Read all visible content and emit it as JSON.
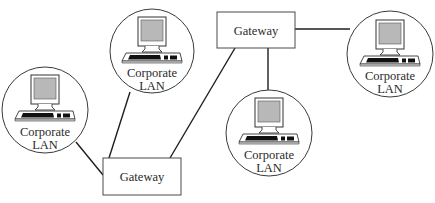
{
  "diagram": {
    "type": "network-topology",
    "colors": {
      "background": "#ffffff",
      "line": "#1e1e1e",
      "outline": "#3a3a3a",
      "screen": "#b8b8b8",
      "keys": "#111111",
      "text": "#2a2a2a"
    },
    "gateways": [
      {
        "id": "gw-bottom",
        "label": "Gateway",
        "x": 103,
        "y": 158,
        "w": 78,
        "h": 37
      },
      {
        "id": "gw-top",
        "label": "Gateway",
        "x": 217,
        "y": 12,
        "w": 78,
        "h": 36
      }
    ],
    "lans": [
      {
        "id": "lan-left",
        "label_line1": "Corporate",
        "label_line2": "LAN",
        "cx": 45,
        "cy": 110,
        "r": 43
      },
      {
        "id": "lan-top-middle",
        "label_line1": "Corporate",
        "label_line2": "LAN",
        "cx": 152,
        "cy": 51,
        "r": 42
      },
      {
        "id": "lan-bottom-middle",
        "label_line1": "Corporate",
        "label_line2": "LAN",
        "cx": 269,
        "cy": 133,
        "r": 43
      },
      {
        "id": "lan-right",
        "label_line1": "Corporate",
        "label_line2": "LAN",
        "cx": 390,
        "cy": 54,
        "r": 43
      }
    ],
    "connections": [
      {
        "from": "lan-left",
        "to": "gw-bottom"
      },
      {
        "from": "lan-top-middle",
        "to": "gw-bottom"
      },
      {
        "from": "gw-bottom",
        "to": "gw-top"
      },
      {
        "from": "gw-top",
        "to": "lan-bottom-middle"
      },
      {
        "from": "gw-top",
        "to": "lan-right"
      }
    ]
  }
}
